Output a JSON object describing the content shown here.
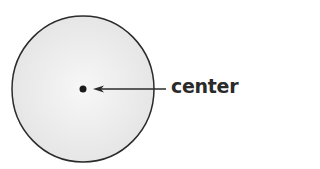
{
  "diagram": {
    "label": "center",
    "colors": {
      "fill": "#ececec",
      "stroke": "#2b2b2b",
      "text": "#2a2a2a"
    }
  }
}
